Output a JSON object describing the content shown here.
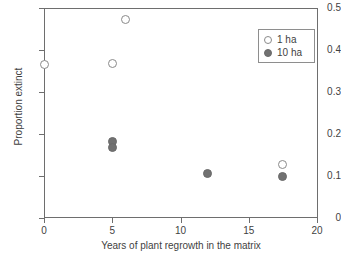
{
  "chart_data": {
    "type": "scatter",
    "title": "",
    "xlabel": "Years of plant regrowth in the matrix",
    "ylabel": "Proportion extinct",
    "xlim": [
      0,
      20
    ],
    "ylim": [
      0,
      0.5
    ],
    "grid": false,
    "legend_position": "top-right",
    "xticks": [
      "0",
      "5",
      "10",
      "15",
      "20"
    ],
    "xtick_values": [
      0,
      5,
      10,
      15,
      20
    ],
    "yticks": [
      "0",
      "0.1",
      "0.2",
      "0.3",
      "0.4",
      "0.5"
    ],
    "ytick_values": [
      0,
      0.1,
      0.2,
      0.3,
      0.4,
      0.5
    ],
    "series": [
      {
        "name": "1 ha",
        "marker": "open-circle",
        "color": "#ffffff",
        "edge_color": "#8a8a8a",
        "points": [
          {
            "x": 0,
            "y": 0.366
          },
          {
            "x": 5,
            "y": 0.369
          },
          {
            "x": 6,
            "y": 0.473
          },
          {
            "x": 17.5,
            "y": 0.128
          }
        ]
      },
      {
        "name": "10 ha",
        "marker": "filled-circle",
        "color": "#717171",
        "edge_color": "#6a6a6a",
        "points": [
          {
            "x": 5,
            "y": 0.183
          },
          {
            "x": 5,
            "y": 0.167
          },
          {
            "x": 12,
            "y": 0.107
          },
          {
            "x": 17.5,
            "y": 0.1
          }
        ]
      }
    ]
  },
  "legend": {
    "entries": [
      {
        "label": "1 ha",
        "marker": "open-circle"
      },
      {
        "label": "10 ha",
        "marker": "filled-circle"
      }
    ]
  }
}
